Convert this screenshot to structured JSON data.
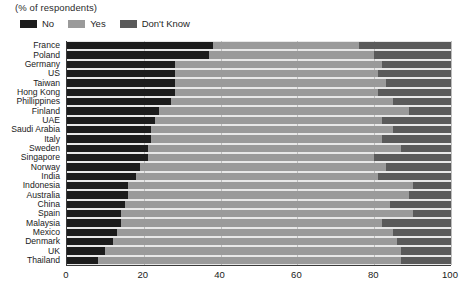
{
  "subtitle": "(% of respondents)",
  "legend": {
    "position": "top-left",
    "items": [
      {
        "label": "No",
        "color": "#1c1c1c",
        "name": "legend-no"
      },
      {
        "label": "Yes",
        "color": "#9a9a9a",
        "name": "legend-yes"
      },
      {
        "label": "Don't Know",
        "color": "#5a5a5a",
        "name": "legend-dont-know"
      }
    ]
  },
  "axis": {
    "x_ticks": [
      "0",
      "20",
      "40",
      "60",
      "80",
      "100"
    ],
    "x_min": 0,
    "x_max": 100
  },
  "colors": {
    "no": "#1c1c1c",
    "yes": "#9a9a9a",
    "dont_know": "#5a5a5a",
    "plot_background": "#e8e8e8",
    "gridline": "#bdbdbd",
    "axis": "#3a3a3a",
    "text": "#1a1a1a"
  },
  "chart_data": {
    "type": "bar",
    "orientation": "horizontal",
    "stacked": true,
    "title": "",
    "subtitle": "(% of respondents)",
    "xlabel": "",
    "ylabel": "",
    "xlim": [
      0,
      100
    ],
    "grid": true,
    "legend_position": "top-left",
    "categories": [
      "France",
      "Poland",
      "Germany",
      "US",
      "Taiwan",
      "Hong Kong",
      "Phillippines",
      "Finland",
      "UAE",
      "Saudi Arabia",
      "Italy",
      "Sweden",
      "Singapore",
      "Norway",
      "India",
      "Indonesia",
      "Australia",
      "China",
      "Spain",
      "Malaysia",
      "Mexico",
      "Denmark",
      "UK",
      "Thailand"
    ],
    "series": [
      {
        "name": "No",
        "color": "#1c1c1c",
        "values": [
          38,
          37,
          28,
          28,
          28,
          28,
          27,
          24,
          23,
          22,
          22,
          21,
          21,
          19,
          18,
          16,
          16,
          15,
          14,
          14,
          13,
          12,
          10,
          8
        ]
      },
      {
        "name": "Yes",
        "color": "#9a9a9a",
        "values": [
          38,
          43,
          54,
          53,
          55,
          53,
          58,
          65,
          59,
          63,
          60,
          66,
          59,
          64,
          63,
          74,
          73,
          69,
          76,
          68,
          72,
          74,
          77,
          79
        ]
      },
      {
        "name": "Don't Know",
        "color": "#5a5a5a",
        "values": [
          24,
          20,
          18,
          19,
          17,
          19,
          15,
          11,
          18,
          15,
          18,
          13,
          20,
          17,
          19,
          10,
          11,
          16,
          10,
          18,
          15,
          14,
          13,
          13
        ]
      }
    ]
  }
}
